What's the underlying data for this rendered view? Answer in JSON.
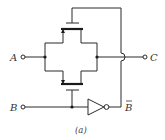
{
  "diagram": {
    "inputs": {
      "a_label": "A",
      "b_label": "B"
    },
    "outputs": {
      "c_label": "C",
      "b_bar_label": "B"
    },
    "caption": "(a)",
    "components": [
      "upper-transistor",
      "lower-transistor",
      "inverter"
    ]
  }
}
